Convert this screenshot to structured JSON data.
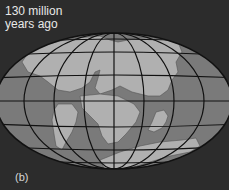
{
  "figure": {
    "caption_line1": "130 million",
    "caption_line2": "years ago",
    "panel_label": "(b)"
  },
  "colors": {
    "background": "#2c2c2c",
    "ocean": "#7a7a7a",
    "land": "#b0b0b0",
    "grid": "#111111"
  }
}
